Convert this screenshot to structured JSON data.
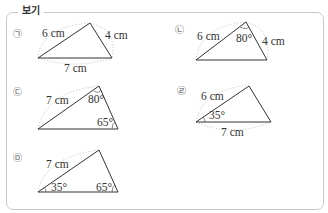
{
  "title": "보기",
  "items": [
    {
      "marker": "㉠",
      "side_a": "6 cm",
      "side_b": "4 cm",
      "base": "7 cm"
    },
    {
      "marker": "㉡",
      "side_a": "6 cm",
      "angle_top": "80°",
      "side_b": "4 cm"
    },
    {
      "marker": "㉢",
      "side_a": "7 cm",
      "angle_top": "80°",
      "angle_right": "65°"
    },
    {
      "marker": "㉣",
      "side_a": "6 cm",
      "angle_left": "35°",
      "base": "7 cm"
    },
    {
      "marker": "㉤",
      "side_a": "7 cm",
      "angle_left": "35°",
      "angle_right": "65°"
    }
  ]
}
